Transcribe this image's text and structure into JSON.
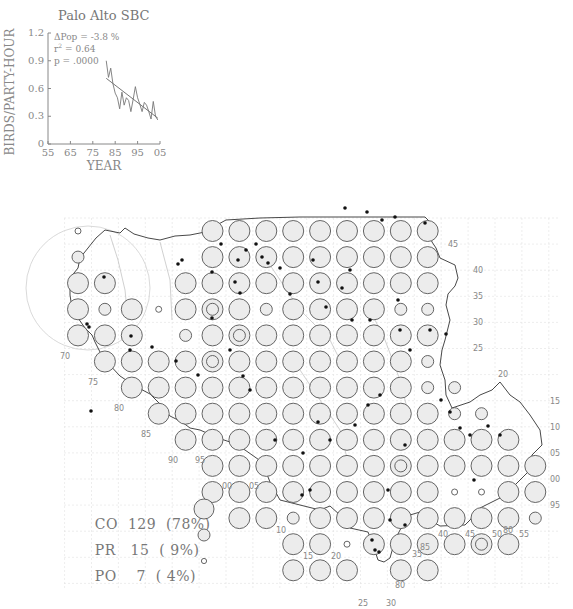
{
  "chart": {
    "title": "Palo Alto SBC",
    "ylabel": "BIRDS/PARTY-HOUR",
    "xlabel": "YEAR",
    "stats": {
      "delta_pop": "ΔPop =  -3.8 %",
      "r2_label": "r",
      "r2_value": " = 0.64",
      "p": "p = .0000"
    },
    "y_ticks": [
      "0",
      "0.3",
      "0.6",
      "0.9",
      "1.2"
    ],
    "x_ticks": [
      "55",
      "65",
      "75",
      "85",
      "95",
      "05"
    ]
  },
  "chart_data": {
    "type": "line",
    "title": "Palo Alto SBC",
    "xlabel": "YEAR",
    "ylabel": "BIRDS/PARTY-HOUR",
    "xlim": [
      1955,
      2005
    ],
    "ylim": [
      0,
      1.2
    ],
    "annotations": [
      "ΔPop = -3.8 %",
      "r² = 0.64",
      "p = .0000"
    ],
    "series": [
      {
        "name": "observed",
        "x": [
          1981,
          1982,
          1983,
          1984,
          1985,
          1986,
          1987,
          1988,
          1989,
          1990,
          1991,
          1992,
          1993,
          1994,
          1995,
          1996,
          1997,
          1998,
          1999,
          2000,
          2001,
          2002,
          2003,
          2004
        ],
        "values": [
          0.9,
          0.72,
          0.82,
          0.65,
          0.55,
          0.5,
          0.38,
          0.56,
          0.42,
          0.5,
          0.47,
          0.35,
          0.48,
          0.62,
          0.5,
          0.43,
          0.35,
          0.45,
          0.42,
          0.35,
          0.27,
          0.46,
          0.3,
          0.26
        ]
      },
      {
        "name": "trend",
        "x": [
          1981,
          2004
        ],
        "values": [
          0.71,
          0.28
        ]
      }
    ]
  },
  "map": {
    "legend": [
      {
        "code": "CO",
        "text": "CO  129  (78%)",
        "count": 129,
        "percent": "78%",
        "symbol": "large-circle"
      },
      {
        "code": "PR",
        "text": "PR   15  ( 9%)",
        "count": 15,
        "percent": "9%",
        "symbol": "medium-circle"
      },
      {
        "code": "PO",
        "text": "PO    7  ( 4%)",
        "count": 7,
        "percent": "4%",
        "symbol": "small-circle"
      }
    ],
    "grid_labels": {
      "right": [
        "45",
        "40",
        "35",
        "30",
        "25",
        "20",
        "15",
        "10",
        "05",
        "00",
        "95"
      ],
      "left": [
        "70",
        "75",
        "80",
        "85"
      ],
      "bottom_left": [
        "90",
        "95",
        "00",
        "05",
        "10",
        "15",
        "20",
        "25",
        "30"
      ],
      "bottom_right": [
        "85",
        "80",
        "35",
        "40",
        "45",
        "50",
        "55",
        "80"
      ]
    },
    "colors": {
      "circle_fill": "#ececec",
      "circle_stroke": "#555555",
      "coast": "#333333",
      "dot": "#111111",
      "grid": "#d8d8d8"
    }
  }
}
